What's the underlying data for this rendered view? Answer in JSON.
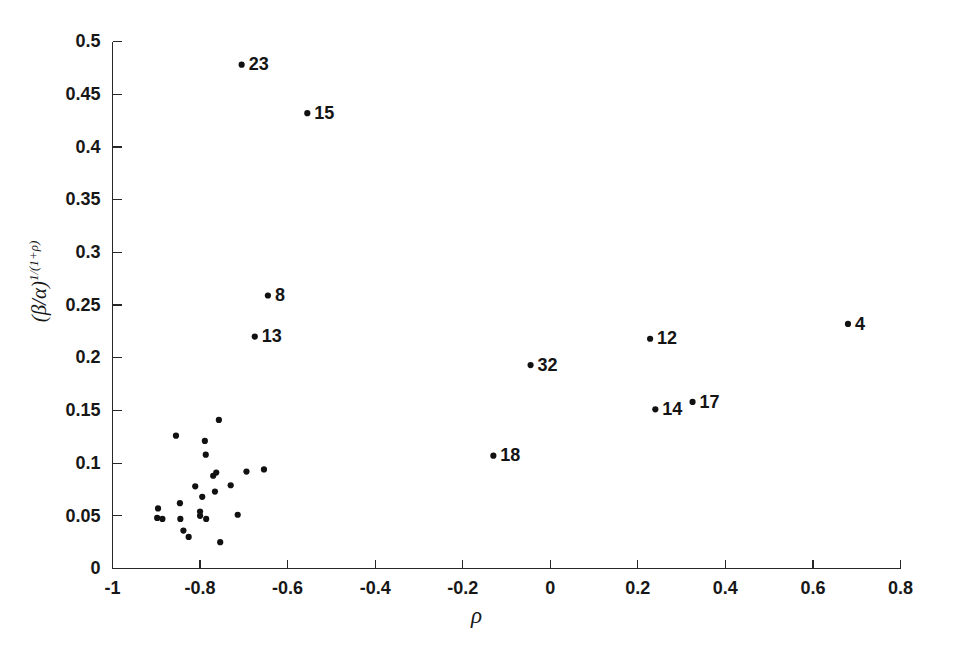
{
  "chart_data": {
    "type": "scatter",
    "title": "",
    "xlabel": "ρ",
    "ylabel": "(β/α)^(1/(1+ρ))",
    "ylabel_base": "(β/α)",
    "ylabel_exponent": "1/(1+ρ)",
    "xlim": [
      -1,
      0.8
    ],
    "ylim": [
      0,
      0.5
    ],
    "xticks": [
      -1,
      -0.8,
      -0.6,
      -0.4,
      -0.2,
      0,
      0.2,
      0.4,
      0.6,
      0.8
    ],
    "xticklabels": [
      "-1",
      "-0.8",
      "-0.6",
      "-0.4",
      "-0.2",
      "0",
      "0.2",
      "0.4",
      "0.6",
      "0.8"
    ],
    "yticks": [
      0,
      0.05,
      0.1,
      0.15,
      0.2,
      0.25,
      0.3,
      0.35,
      0.4,
      0.45,
      0.5
    ],
    "yticklabels": [
      "0",
      "0.05",
      "0.1",
      "0.15",
      "0.2",
      "0.25",
      "0.3",
      "0.35",
      "0.4",
      "0.45",
      "0.5"
    ],
    "grid": false,
    "legend": false,
    "marker_color": "#111111",
    "marker_size": 3.1,
    "labeled_points": [
      {
        "label": "23",
        "x": -0.705,
        "y": 0.478
      },
      {
        "label": "15",
        "x": -0.555,
        "y": 0.432
      },
      {
        "label": "8",
        "x": -0.645,
        "y": 0.259
      },
      {
        "label": "13",
        "x": -0.675,
        "y": 0.22
      },
      {
        "label": "4",
        "x": 0.68,
        "y": 0.232
      },
      {
        "label": "12",
        "x": 0.228,
        "y": 0.218
      },
      {
        "label": "32",
        "x": -0.045,
        "y": 0.193
      },
      {
        "label": "17",
        "x": 0.325,
        "y": 0.158
      },
      {
        "label": "14",
        "x": 0.24,
        "y": 0.151
      },
      {
        "label": "18",
        "x": -0.13,
        "y": 0.107
      }
    ],
    "unlabeled_points": [
      {
        "x": -0.855,
        "y": 0.126
      },
      {
        "x": -0.787,
        "y": 0.108
      },
      {
        "x": -0.789,
        "y": 0.121
      },
      {
        "x": -0.757,
        "y": 0.141
      },
      {
        "x": -0.77,
        "y": 0.088
      },
      {
        "x": -0.763,
        "y": 0.091
      },
      {
        "x": -0.694,
        "y": 0.092
      },
      {
        "x": -0.654,
        "y": 0.094
      },
      {
        "x": -0.811,
        "y": 0.078
      },
      {
        "x": -0.73,
        "y": 0.079
      },
      {
        "x": -0.766,
        "y": 0.073
      },
      {
        "x": -0.795,
        "y": 0.068
      },
      {
        "x": -0.896,
        "y": 0.057
      },
      {
        "x": -0.898,
        "y": 0.048
      },
      {
        "x": -0.886,
        "y": 0.047
      },
      {
        "x": -0.846,
        "y": 0.062
      },
      {
        "x": -0.845,
        "y": 0.047
      },
      {
        "x": -0.8,
        "y": 0.05
      },
      {
        "x": -0.8,
        "y": 0.054
      },
      {
        "x": -0.786,
        "y": 0.047
      },
      {
        "x": -0.838,
        "y": 0.036
      },
      {
        "x": -0.826,
        "y": 0.03
      },
      {
        "x": -0.754,
        "y": 0.025
      },
      {
        "x": -0.714,
        "y": 0.051
      }
    ]
  },
  "figure": {
    "background_color": "#ffffff",
    "axis_color": "#272727"
  }
}
